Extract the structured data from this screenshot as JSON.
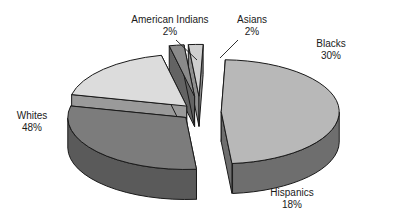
{
  "chart_data": {
    "type": "pie",
    "title": "",
    "subtitle": "",
    "xlabel": "",
    "ylabel": "",
    "style": "3d-exploded-grayscale",
    "legend_position": "none",
    "grid": false,
    "labels_show_percent": true,
    "categories": [
      "Whites",
      "Blacks",
      "Hispanics",
      "American Indians",
      "Asians"
    ],
    "values": [
      48,
      30,
      18,
      2,
      2
    ],
    "unit": "%",
    "total": 100,
    "slices": [
      {
        "name": "Whites",
        "value": 48,
        "value_text": "48%",
        "top_color": "#b8b8b8",
        "side_color": "#6e6e6e",
        "explode": 0.18,
        "label_anchor": "left"
      },
      {
        "name": "Blacks",
        "value": 30,
        "value_text": "30%",
        "top_color": "#7c7c7c",
        "side_color": "#5a5a5a",
        "explode": 0.16,
        "label_anchor": "right"
      },
      {
        "name": "Hispanics",
        "value": 18,
        "value_text": "18%",
        "top_color": "#dcdcdc",
        "side_color": "#9a9a9a",
        "explode": 0.16,
        "label_anchor": "bottom"
      },
      {
        "name": "American Indians",
        "value": 2,
        "value_text": "2%",
        "top_color": "#8a8a8a",
        "side_color": "#636363",
        "explode": 0.3,
        "label_anchor": "top-left"
      },
      {
        "name": "Asians",
        "value": 2,
        "value_text": "2%",
        "top_color": "#cfcfcf",
        "side_color": "#8f8f8f",
        "explode": 0.3,
        "label_anchor": "top-right"
      }
    ]
  },
  "geometry": {
    "cx": 200,
    "cy": 112,
    "rx": 118,
    "ry": 52,
    "depth": 30,
    "start_angle_deg": 88,
    "direction": "clockwise",
    "outline_color": "#1a1a1a",
    "outline_width": 1
  },
  "labels": {
    "american_indians": {
      "name": "American Indians",
      "value": "2%"
    },
    "asians": {
      "name": "Asians",
      "value": "2%"
    },
    "blacks": {
      "name": "Blacks",
      "value": "30%"
    },
    "whites": {
      "name": "Whites",
      "value": "48%"
    },
    "hispanics": {
      "name": "Hispanics",
      "value": "18%"
    }
  },
  "leader_lines": [
    {
      "name": "american-indians-leader",
      "x1": 176,
      "y1": 40,
      "x2": 197,
      "y2": 60
    },
    {
      "name": "asians-leader",
      "x1": 238,
      "y1": 40,
      "x2": 220,
      "y2": 58
    }
  ],
  "colors": {
    "background": "#ffffff",
    "text": "#1a1a1a",
    "outline": "#1a1a1a"
  }
}
